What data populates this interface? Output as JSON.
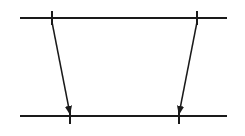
{
  "diagram": {
    "type": "timing-diagram",
    "stroke_color": "#1a1a1a",
    "background": "#ffffff",
    "lines": [
      {
        "id": "top-timeline",
        "x1": 20,
        "y1": 18,
        "x2": 227,
        "y2": 18
      },
      {
        "id": "bottom-timeline",
        "x1": 20,
        "y1": 116,
        "x2": 227,
        "y2": 116
      }
    ],
    "ticks": [
      {
        "id": "top-left-tick",
        "x": 52,
        "y1": 11,
        "y2": 25
      },
      {
        "id": "top-right-tick",
        "x": 197,
        "y1": 11,
        "y2": 25
      },
      {
        "id": "bottom-left-tick",
        "x": 70,
        "y1": 108,
        "y2": 124
      },
      {
        "id": "bottom-right-tick",
        "x": 179,
        "y1": 108,
        "y2": 124
      }
    ],
    "arrows": [
      {
        "id": "left-arrow",
        "x1": 52,
        "y1": 22,
        "x2": 70,
        "y2": 114
      },
      {
        "id": "right-arrow",
        "x1": 197,
        "y1": 22,
        "x2": 179,
        "y2": 114
      }
    ]
  }
}
